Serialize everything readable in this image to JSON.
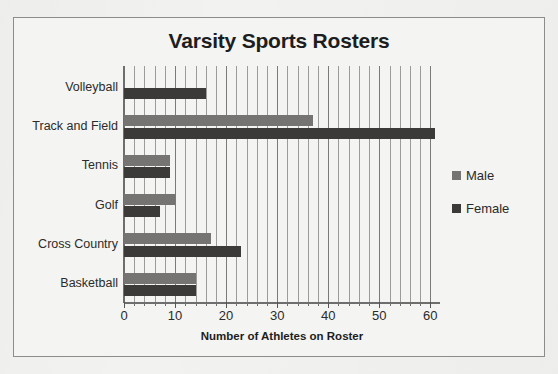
{
  "chart_data": {
    "type": "bar",
    "orientation": "horizontal",
    "title": "Varsity Sports Rosters",
    "xlabel": "Number of Athletes on Roster",
    "ylabel": "",
    "xlim": [
      0,
      61.5
    ],
    "xticks": [
      0,
      10,
      20,
      30,
      40,
      50,
      60
    ],
    "xtick_labels": [
      "0",
      "10",
      "20",
      "30",
      "40",
      "50",
      "60"
    ],
    "minor_tick_step": 2,
    "grid": true,
    "grid_axis": "x",
    "legend_position": "right",
    "categories": [
      "Volleyball",
      "Track and Field",
      "Tennis",
      "Golf",
      "Cross Country",
      "Basketball"
    ],
    "series": [
      {
        "name": "Male",
        "color": "#767472",
        "values": [
          0,
          37,
          9,
          10,
          17,
          14
        ]
      },
      {
        "name": "Female",
        "color": "#3b3a38",
        "values": [
          16,
          61,
          9,
          7,
          23,
          14
        ]
      }
    ]
  },
  "legend": {
    "items": [
      {
        "label": "Male"
      },
      {
        "label": "Female"
      }
    ]
  },
  "colors": {
    "male": "#767472",
    "female": "#3b3a38",
    "frame": "#8c8c8c",
    "grid": "#9b9b9b",
    "text": "#2b2b2b",
    "page": "#f2f2f0"
  }
}
